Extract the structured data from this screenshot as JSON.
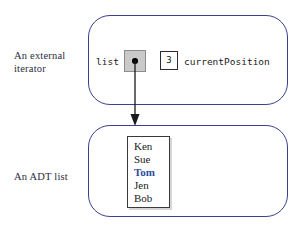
{
  "figure": {
    "background_color": "#ffffff",
    "box_border_color": "#3a3f8e",
    "highlight_color": "#2a4c9b"
  },
  "captions": {
    "iterator": "An external\niterator",
    "adt_list": "An ADT list"
  },
  "iterator": {
    "reference_label": "list",
    "pointer_cell_fill": "#c9c9c9",
    "position_value": "3",
    "position_label": "currentPosition"
  },
  "adt_list": {
    "items": [
      {
        "value": "Ken",
        "current": false
      },
      {
        "value": "Sue",
        "current": false
      },
      {
        "value": "Tom",
        "current": true
      },
      {
        "value": "Jen",
        "current": false
      },
      {
        "value": "Bob",
        "current": false
      }
    ]
  },
  "arrow": {
    "label": "pointer-from-iterator-to-list"
  }
}
